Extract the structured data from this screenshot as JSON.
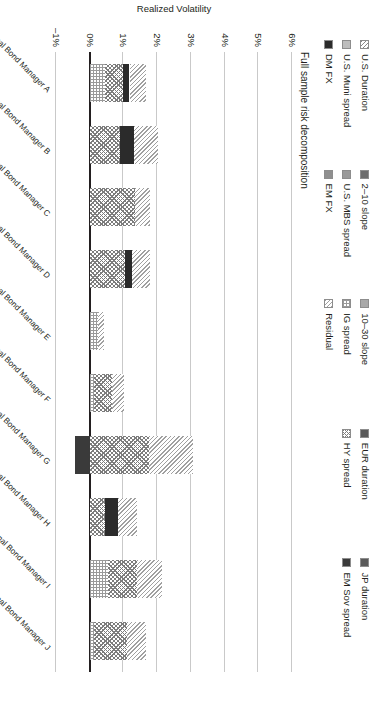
{
  "chart_data": {
    "type": "bar",
    "title": "Full sample risk decomposition",
    "subtitle": "",
    "xlabel": "",
    "ylabel": "Realized Volatility",
    "ylim": [
      -1,
      6
    ],
    "yticks": [
      "6%",
      "5%",
      "4%",
      "3%",
      "2%",
      "1%",
      "0%",
      "–1%"
    ],
    "ytick_values": [
      6,
      5,
      4,
      3,
      2,
      1,
      0,
      -1
    ],
    "grid": true,
    "stacked": true,
    "orientation": "vertical",
    "legend_position": "top",
    "categories": [
      "Nontraditional Bond Manager A",
      "Nontraditional Bond Manager B",
      "Nontraditional Bond Manager C",
      "Nontraditional Bond Manager D",
      "Nontraditional Bond Manager E",
      "Nontraditional Bond Manager F",
      "Nontraditional Bond Manager G",
      "Nontraditional Bond Manager H",
      "Nontraditional Bond Manager I",
      "Nontraditional Bond Manager J"
    ],
    "series": [
      {
        "name": "U.S. Duration",
        "pattern": "diagonal-hatch-light",
        "values": [
          0.0,
          0.0,
          0.0,
          0.0,
          0.0,
          0.0,
          0.0,
          0.0,
          0.0,
          0.0
        ]
      },
      {
        "name": "2–10 slope",
        "pattern": "solid-dark-gray",
        "values": [
          0.0,
          0.0,
          0.0,
          0.0,
          0.0,
          0.0,
          0.0,
          0.0,
          0.0,
          0.0
        ]
      },
      {
        "name": "10–30 slope",
        "pattern": "solid-mid-gray",
        "values": [
          0.0,
          0.0,
          0.0,
          0.0,
          0.0,
          0.0,
          0.0,
          0.0,
          0.0,
          0.0
        ]
      },
      {
        "name": "JP duration",
        "pattern": "solid-charcoal",
        "values": [
          0.0,
          0.0,
          0.0,
          0.0,
          0.0,
          0.0,
          0.0,
          0.0,
          0.0,
          0.0
        ]
      },
      {
        "name": "U.S. Muni spread",
        "pattern": "solid-light-gray",
        "values": [
          0.0,
          0.0,
          0.0,
          0.0,
          0.0,
          0.0,
          0.0,
          0.0,
          0.0,
          0.0
        ]
      },
      {
        "name": "U.S. MBS spread",
        "pattern": "solid-gray",
        "values": [
          0.0,
          0.0,
          0.0,
          0.0,
          0.0,
          0.0,
          0.0,
          0.0,
          0.0,
          0.0
        ]
      },
      {
        "name": "IG spread",
        "pattern": "dotted-grid",
        "values": [
          0.45,
          0.0,
          0.0,
          0.0,
          0.25,
          0.12,
          0.0,
          0.0,
          0.55,
          0.12
        ]
      },
      {
        "name": "HY spread",
        "pattern": "cross-hatch",
        "values": [
          0.55,
          0.9,
          1.35,
          1.05,
          0.0,
          0.55,
          1.75,
          0.45,
          0.85,
          1.0
        ]
      },
      {
        "name": "DM FX",
        "pattern": "solid-black",
        "values": [
          0.18,
          0.42,
          0.0,
          0.2,
          0.0,
          0.0,
          0.0,
          0.4,
          0.0,
          0.0
        ]
      },
      {
        "name": "EM FX",
        "pattern": "solid-mid-gray",
        "values": [
          0.0,
          0.0,
          0.0,
          0.0,
          0.0,
          0.0,
          0.0,
          0.0,
          0.0,
          0.0
        ]
      },
      {
        "name": "Residual",
        "pattern": "diagonal-hatch",
        "values": [
          0.5,
          0.7,
          0.45,
          0.55,
          0.18,
          0.35,
          1.3,
          0.55,
          0.75,
          0.55
        ]
      },
      {
        "name": "EM Sov spread",
        "pattern": "solid-dark",
        "values": [
          0.0,
          0.0,
          0.0,
          0.0,
          0.0,
          0.0,
          -0.45,
          0.0,
          0.0,
          0.0
        ]
      }
    ],
    "bar_totals": [
      1.68,
      2.02,
      1.8,
      1.8,
      0.43,
      1.02,
      4.8,
      1.4,
      2.15,
      1.67
    ],
    "annotations": []
  },
  "legend": {
    "items": [
      {
        "label": "U.S. Duration",
        "swatch": "p-usdur"
      },
      {
        "label": "U.S. Muni spread",
        "swatch": "p-muni"
      },
      {
        "label": "DM FX",
        "swatch": "p-dmfx"
      },
      {
        "label": "2–10 slope",
        "swatch": "p-210"
      },
      {
        "label": "U.S. MBS spread",
        "swatch": "p-mbs"
      },
      {
        "label": "EM FX",
        "swatch": "p-emfx"
      },
      {
        "label": "10–30 slope",
        "swatch": "p-1030"
      },
      {
        "label": "IG spread",
        "swatch": "p-ig"
      },
      {
        "label": "Residual",
        "swatch": "p-resid"
      },
      {
        "label": "EUR duration",
        "swatch": "p-jp"
      },
      {
        "label": "HY spread",
        "swatch": "p-hy"
      },
      {
        "label": "JP duration",
        "swatch": "p-jp"
      },
      {
        "label": "EM Sov spread",
        "swatch": "p-emsov"
      }
    ],
    "column1": [
      {
        "label": "U.S. Duration",
        "swatch": "p-usdur"
      },
      {
        "label": "U.S. Muni spread",
        "swatch": "p-muni"
      },
      {
        "label": "DM FX",
        "swatch": "p-dmfx"
      }
    ],
    "column2": [
      {
        "label": "2–10 slope",
        "swatch": "p-210"
      },
      {
        "label": "U.S. MBS spread",
        "swatch": "p-mbs"
      },
      {
        "label": "EM FX",
        "swatch": "p-emfx"
      }
    ],
    "column3": [
      {
        "label": "10–30 slope",
        "swatch": "p-1030"
      },
      {
        "label": "IG spread",
        "swatch": "p-ig"
      },
      {
        "label": "Residual",
        "swatch": "p-resid"
      }
    ],
    "column4": [
      {
        "label": "EUR duration",
        "swatch": "p-jp"
      },
      {
        "label": "HY spread",
        "swatch": "p-hy"
      },
      {
        "label": "",
        "swatch": ""
      }
    ],
    "column5": [
      {
        "label": "JP duration",
        "swatch": "p-jp"
      },
      {
        "label": "EM Sov spread",
        "swatch": "p-emsov"
      }
    ]
  },
  "colors": {
    "text": "#231f20",
    "gridline": "#c9c9c9",
    "zeroline": "#231f20",
    "background": "#ffffff"
  }
}
